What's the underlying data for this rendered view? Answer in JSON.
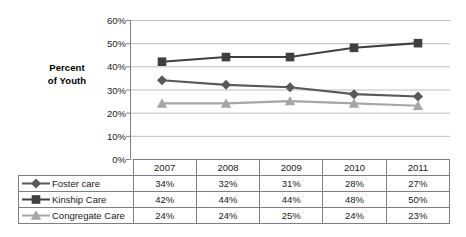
{
  "chart_data": {
    "type": "line",
    "title": "",
    "xlabel": "",
    "ylabel": "Percent of Youth",
    "ylabel_line1": "Percent",
    "ylabel_line2": "of Youth",
    "categories": [
      "2007",
      "2008",
      "2009",
      "2010",
      "2011"
    ],
    "ylim": [
      0,
      60
    ],
    "ytick_labels": [
      "0%",
      "10%",
      "20%",
      "30%",
      "40%",
      "50%",
      "60%"
    ],
    "ytick_values": [
      0,
      10,
      20,
      30,
      40,
      50,
      60
    ],
    "grid": true,
    "legend_position": "table-left-column",
    "series": [
      {
        "name": "Foster care",
        "marker": "diamond",
        "color": "#595959",
        "values": [
          34,
          32,
          31,
          28,
          27
        ],
        "labels": [
          "34%",
          "32%",
          "31%",
          "28%",
          "27%"
        ]
      },
      {
        "name": "Kinship Care",
        "marker": "square",
        "color": "#404040",
        "values": [
          42,
          44,
          44,
          48,
          50
        ],
        "labels": [
          "42%",
          "44%",
          "44%",
          "48%",
          "50%"
        ]
      },
      {
        "name": "Congregate Care",
        "marker": "triangle",
        "color": "#a6a6a6",
        "values": [
          24,
          24,
          25,
          24,
          23
        ],
        "labels": [
          "24%",
          "24%",
          "25%",
          "24%",
          "23%"
        ]
      }
    ]
  },
  "table": {
    "header_blank": "",
    "year_headers": [
      "2007",
      "2008",
      "2009",
      "2010",
      "2011"
    ],
    "rows": [
      {
        "label": "Foster care",
        "marker": "diamond-marker-icon",
        "values": [
          "34%",
          "32%",
          "31%",
          "28%",
          "27%"
        ]
      },
      {
        "label": "Kinship Care",
        "marker": "square-marker-icon",
        "values": [
          "42%",
          "44%",
          "44%",
          "48%",
          "50%"
        ]
      },
      {
        "label": "Congregate Care",
        "marker": "triangle-marker-icon",
        "values": [
          "24%",
          "24%",
          "25%",
          "24%",
          "23%"
        ]
      }
    ]
  },
  "colors": {
    "foster": "#595959",
    "kinship": "#404040",
    "congregate": "#a6a6a6",
    "grid": "#bfbfbf",
    "axis": "#808080",
    "table_border": "#7f7f7f"
  }
}
